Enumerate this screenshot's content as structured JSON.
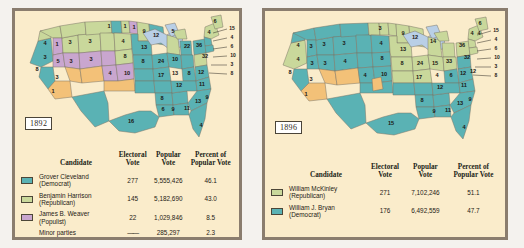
{
  "page": {
    "background": "#f4f2ee",
    "frame_color": "#8a7d6e",
    "panel_background": "#faeccb"
  },
  "colors": {
    "democrat_teal": "#5ab2b4",
    "republican_green": "#c9d89b",
    "populist_purple": "#c9a6cf",
    "orange_territory": "#f3c178",
    "lake_blue": "#b9cfe6",
    "state_border": "#7a7466",
    "text": "#1e1b15"
  },
  "columns": {
    "candidate": "Candidate",
    "electoral_vote": "Electoral\nVote",
    "electoral_vote_line1": "Electoral",
    "electoral_vote_line2": "Vote",
    "popular_vote_line1": "Popular",
    "popular_vote_line2": "Vote",
    "percent_line1": "Percent of",
    "percent_line2": "Popular Vote"
  },
  "maps": [
    {
      "id": "map-1892",
      "year": "1892",
      "title": "Election of 1892",
      "legend_rows": [
        {
          "swatch": "#5ab2b4",
          "name_line1": "Grover Cleveland",
          "name_line2": "(Democrat)",
          "electoral": "277",
          "popular": "5,555,426",
          "percent": "46.1"
        },
        {
          "swatch": "#c9d89b",
          "name_line1": "Benjamin Harrison",
          "name_line2": "(Republican)",
          "electoral": "145",
          "popular": "5,182,690",
          "percent": "43.0"
        },
        {
          "swatch": "#c9a6cf",
          "name_line1": "James B. Weaver",
          "name_line2": "(Populist)",
          "electoral": "22",
          "popular": "1,029,846",
          "percent": "8.5"
        },
        {
          "swatch": "",
          "name_line1": "Minor parties",
          "name_line2": "",
          "electoral": "——",
          "popular": "285,297",
          "percent": "2.3"
        }
      ],
      "state_labels": [
        "4",
        "3",
        "1",
        "5",
        "3",
        "8",
        "1",
        "3",
        "4",
        "3",
        "1",
        "1",
        "1",
        "9",
        "8",
        "13",
        "12",
        "5",
        "22",
        "36",
        "6",
        "4",
        "32",
        "4",
        "9",
        "4",
        "10",
        "24",
        "10",
        "15",
        "8",
        "12",
        "17",
        "13",
        "12",
        "11",
        "8",
        "9",
        "11",
        "13",
        "9",
        "16",
        "6",
        "4"
      ],
      "leader_labels": [
        "15",
        "4",
        "6",
        "10",
        "3",
        "8"
      ]
    },
    {
      "id": "map-1896",
      "year": "1896",
      "title": "Election of 1896",
      "legend_rows": [
        {
          "swatch": "#c9d89b",
          "name_line1": "William McKinley",
          "name_line2": "(Republican)",
          "electoral": "271",
          "popular": "7,102,246",
          "percent": "51.1"
        },
        {
          "swatch": "#5ab2b4",
          "name_line1": "William J. Bryan",
          "name_line2": "(Democrat)",
          "electoral": "176",
          "popular": "6,492,559",
          "percent": "47.7"
        }
      ],
      "state_labels": [
        "4",
        "4",
        "3",
        "3",
        "3",
        "3",
        "4",
        "9",
        "12",
        "14",
        "36",
        "6",
        "4",
        "4",
        "32",
        "8",
        "3",
        "8",
        "13",
        "24",
        "15",
        "33",
        "6",
        "12",
        "12",
        "1",
        "4",
        "10",
        "17",
        "12",
        "11",
        "9",
        "9",
        "8",
        "11",
        "13",
        "9",
        "15",
        "8",
        "4"
      ],
      "leader_labels": [
        "15",
        "4",
        "6",
        "10",
        "3",
        "8"
      ]
    }
  ]
}
